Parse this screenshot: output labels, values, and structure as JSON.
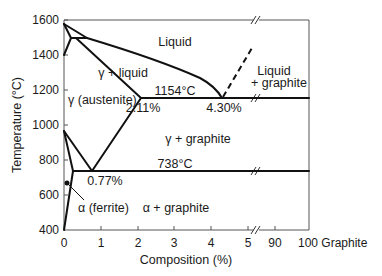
{
  "diagram": {
    "type": "phase-diagram",
    "x_axis": {
      "title": "Composition (%)",
      "ticks": [
        "0",
        "1",
        "2",
        "3",
        "4",
        "5",
        "90",
        "100 Graphite"
      ],
      "range": [
        0,
        100
      ],
      "break_between": [
        5,
        90
      ]
    },
    "y_axis": {
      "title": "Temperature (°C)",
      "ticks": [
        "1600",
        "1400",
        "1200",
        "1000",
        "800",
        "600",
        "400"
      ],
      "range": [
        400,
        1600
      ]
    },
    "regions": {
      "liquid": "Liquid",
      "gamma_liquid": "γ + liquid",
      "austenite": "γ (austenite)",
      "liquid_graphite_1": "Liquid",
      "liquid_graphite_2": "+ graphite",
      "gamma_graphite": "γ + graphite",
      "ferrite": "α (ferrite)",
      "alpha_graphite": "α + graphite"
    },
    "annotations": {
      "eutectic_temp": "1154°C",
      "eutectic_comp": "4.30%",
      "max_solubility": "2.11%",
      "eutectoid_temp": "738°C",
      "eutectoid_comp": "0.77%"
    },
    "colors": {
      "line": "#111111",
      "axis": "#555555",
      "background": "#ffffff"
    }
  }
}
